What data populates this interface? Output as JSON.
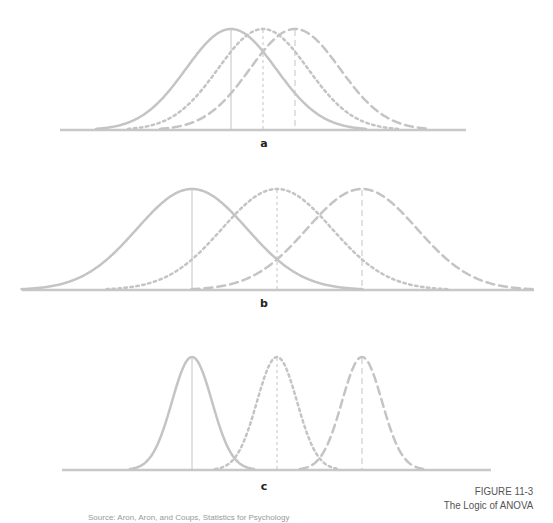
{
  "figure": {
    "caption_title": "FIGURE 11-3",
    "caption_subtitle": "The Logic of ANOVA",
    "footnote": "Source: Aron, Aron, and Coups, Statistics for Psychology",
    "colors": {
      "curve": "#c4c4c4",
      "baseline": "#c8c8c8",
      "label": "#222222",
      "caption": "#555555"
    }
  },
  "panels": [
    {
      "label": "a"
    },
    {
      "label": "b"
    },
    {
      "label": "c"
    }
  ],
  "chart_data": [
    {
      "type": "line",
      "title": "a",
      "description": "Three overlapping normal distributions with close means and large spread",
      "series": [
        {
          "name": "solid",
          "style": "solid",
          "mean_x": 231,
          "sd_px": 45
        },
        {
          "name": "dotted",
          "style": "dotted",
          "mean_x": 263,
          "sd_px": 45
        },
        {
          "name": "dashed",
          "style": "dashed",
          "mean_x": 295,
          "sd_px": 45
        }
      ],
      "grid": false,
      "legend": null
    },
    {
      "type": "line",
      "title": "b",
      "description": "Three normal distributions with widely separated means and large spread",
      "series": [
        {
          "name": "solid",
          "style": "solid",
          "mean_x": 192,
          "sd_px": 55
        },
        {
          "name": "dotted",
          "style": "dotted",
          "mean_x": 277,
          "sd_px": 55
        },
        {
          "name": "dashed",
          "style": "dashed",
          "mean_x": 362,
          "sd_px": 55
        }
      ],
      "grid": false,
      "legend": null
    },
    {
      "type": "line",
      "title": "c",
      "description": "Three normal distributions with widely separated means and small spread",
      "series": [
        {
          "name": "solid",
          "style": "solid",
          "mean_x": 192,
          "sd_px": 20
        },
        {
          "name": "dotted",
          "style": "dotted",
          "mean_x": 277,
          "sd_px": 20
        },
        {
          "name": "dashed",
          "style": "dashed",
          "mean_x": 362,
          "sd_px": 20
        }
      ],
      "grid": false,
      "legend": null
    }
  ]
}
